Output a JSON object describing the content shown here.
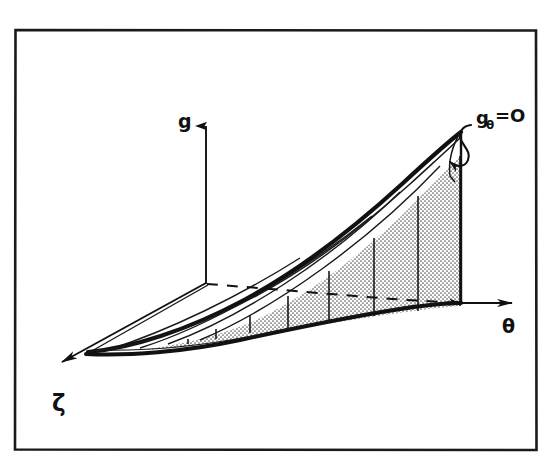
{
  "figure": {
    "kind": "hand-drawn 3d ruled surface diagram",
    "background_color": "#ffffff",
    "ink_color": "#111111",
    "shade_color": "#c9c9c9",
    "frame": {
      "name": "figure-border",
      "x": 14,
      "y": 29,
      "width": 523,
      "height": 422,
      "stroke_width": 2.5
    },
    "axes": [
      {
        "id": "g",
        "label": "g",
        "direction": "up",
        "label_x": 178,
        "label_y": 121,
        "arrow_from": [
          206,
          283
        ],
        "arrow_to": [
          206,
          116
        ]
      },
      {
        "id": "theta",
        "label": "θ",
        "direction": "right",
        "label_x": 508,
        "label_y": 327,
        "arrow_from": [
          455,
          303
        ],
        "arrow_to": [
          522,
          303
        ]
      },
      {
        "id": "zeta",
        "label": "ζ",
        "direction": "down-left",
        "label_x": 58,
        "label_y": 404,
        "arrow_from": [
          206,
          283
        ],
        "arrow_to": [
          50,
          370
        ]
      }
    ],
    "annotation": {
      "id": "g-theta-zero",
      "text_main": "g",
      "text_sub": "θ",
      "text_rest": "=O",
      "full_text": "gθ=O",
      "label_x": 476,
      "label_y": 122,
      "leader_kind": "squiggle-with-arrowhead",
      "arrow_tip": [
        444,
        161
      ]
    },
    "surface": {
      "shaded_region_label": "stippled region under surface",
      "ruling_count": 11,
      "dashed_line_label": "theta-direction dashed line",
      "top_ridge_label": "surface top ridge curve",
      "bottom_edge_label": "surface bottom edge curve"
    }
  }
}
